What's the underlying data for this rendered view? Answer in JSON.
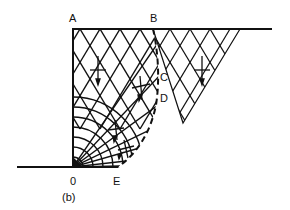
{
  "figure": {
    "caption": "(b)",
    "points": {
      "A": "A",
      "B": "B",
      "C": "C",
      "D": "D",
      "O": "0",
      "E": "E"
    },
    "colors": {
      "ink": "#111111",
      "background": "#ffffff"
    }
  }
}
